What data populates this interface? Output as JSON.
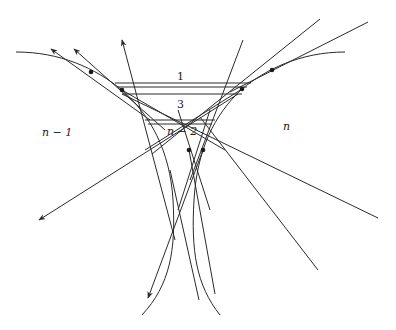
{
  "diagram": {
    "type": "geometric construction",
    "labels": {
      "top_band": "1",
      "middle_band": "3",
      "lower_band": "n − 2",
      "left_region": "n − 1",
      "right_region": "n"
    },
    "colors": {
      "stroke": "#2a2a2a",
      "background": "#ffffff"
    },
    "points": [
      {
        "x": 91,
        "y": 72
      },
      {
        "x": 122,
        "y": 90
      },
      {
        "x": 242,
        "y": 89
      },
      {
        "x": 272,
        "y": 70
      },
      {
        "x": 189,
        "y": 150
      },
      {
        "x": 203,
        "y": 150
      }
    ]
  }
}
